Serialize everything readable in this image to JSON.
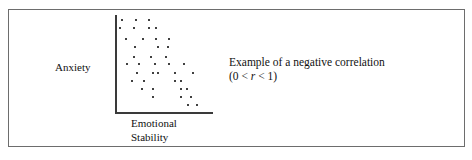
{
  "figure": {
    "y_axis_label": "Anxiety",
    "x_axis_label_line1": "Emotional",
    "x_axis_label_line2": "Stability",
    "caption_line1": "Example of a negative correlation",
    "caption_line2_prefix": "(0 < ",
    "caption_line2_var": "r",
    "caption_line2_suffix": " < 1)",
    "frame_color": "#6d6d6d",
    "axis_color": "#3a3a3a",
    "point_color": "#404040",
    "text_color": "#111111"
  },
  "chart_data": {
    "type": "scatter",
    "title": "Example of a negative correlation",
    "xlabel": "Emotional Stability",
    "ylabel": "Anxiety",
    "annotations": [
      "(0 < r < 1)"
    ],
    "grid": false,
    "legend": null,
    "xlim": [
      0,
      100
    ],
    "ylim": [
      0,
      100
    ],
    "correlation_sign": "negative",
    "axis_ticks": false,
    "points_px": [
      [
        121,
        19
      ],
      [
        135,
        19
      ],
      [
        148,
        19
      ],
      [
        119,
        27
      ],
      [
        133,
        27
      ],
      [
        148,
        27
      ],
      [
        155,
        27
      ],
      [
        125,
        38
      ],
      [
        142,
        38
      ],
      [
        155,
        38
      ],
      [
        168,
        38
      ],
      [
        134,
        46
      ],
      [
        157,
        46
      ],
      [
        167,
        46
      ],
      [
        133,
        56
      ],
      [
        150,
        56
      ],
      [
        165,
        56
      ],
      [
        126,
        63
      ],
      [
        138,
        63
      ],
      [
        154,
        63
      ],
      [
        168,
        63
      ],
      [
        183,
        63
      ],
      [
        136,
        72
      ],
      [
        152,
        72
      ],
      [
        157,
        72
      ],
      [
        174,
        72
      ],
      [
        192,
        72
      ],
      [
        131,
        80
      ],
      [
        143,
        80
      ],
      [
        174,
        80
      ],
      [
        180,
        80
      ],
      [
        141,
        88
      ],
      [
        152,
        88
      ],
      [
        180,
        88
      ],
      [
        186,
        88
      ],
      [
        152,
        96
      ],
      [
        180,
        96
      ],
      [
        190,
        96
      ],
      [
        187,
        104
      ],
      [
        196,
        104
      ]
    ],
    "x": [
      6,
      20,
      33,
      4,
      18,
      33,
      40,
      10,
      27,
      40,
      53,
      19,
      42,
      52,
      18,
      35,
      50,
      11,
      23,
      39,
      53,
      68,
      21,
      37,
      42,
      59,
      77,
      16,
      28,
      59,
      65,
      26,
      37,
      65,
      71,
      37,
      65,
      75,
      72,
      81
    ],
    "y": [
      95,
      95,
      95,
      87,
      87,
      87,
      87,
      76,
      76,
      76,
      76,
      68,
      68,
      68,
      58,
      58,
      58,
      51,
      51,
      51,
      51,
      51,
      42,
      42,
      42,
      42,
      42,
      34,
      34,
      34,
      34,
      26,
      26,
      26,
      26,
      18,
      18,
      18,
      10,
      10
    ]
  }
}
